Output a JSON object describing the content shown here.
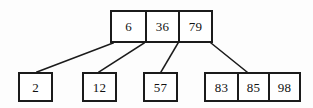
{
  "diagram": {
    "type": "b-tree",
    "canvas": {
      "width": 313,
      "height": 108,
      "background": "#fdfdfd"
    },
    "stroke_color": "#1b1b1b",
    "text_color": "#111111",
    "root": {
      "name": "root-node",
      "keys": [
        "6",
        "36",
        "79"
      ]
    },
    "children": [
      {
        "name": "child-node-1",
        "keys": [
          "2"
        ]
      },
      {
        "name": "child-node-2",
        "keys": [
          "12"
        ]
      },
      {
        "name": "child-node-3",
        "keys": [
          "57"
        ]
      },
      {
        "name": "child-node-4",
        "keys": [
          "83",
          "85",
          "98"
        ]
      }
    ],
    "edges": [
      {
        "name": "edge-root-to-child-1",
        "x1": 113,
        "y1": 43,
        "x2": 37,
        "y2": 72
      },
      {
        "name": "edge-root-to-child-2",
        "x1": 144,
        "y1": 43,
        "x2": 99,
        "y2": 72
      },
      {
        "name": "edge-root-to-child-3",
        "x1": 178,
        "y1": 43,
        "x2": 161,
        "y2": 72
      },
      {
        "name": "edge-root-to-child-4",
        "x1": 211,
        "y1": 43,
        "x2": 247,
        "y2": 72
      }
    ]
  }
}
